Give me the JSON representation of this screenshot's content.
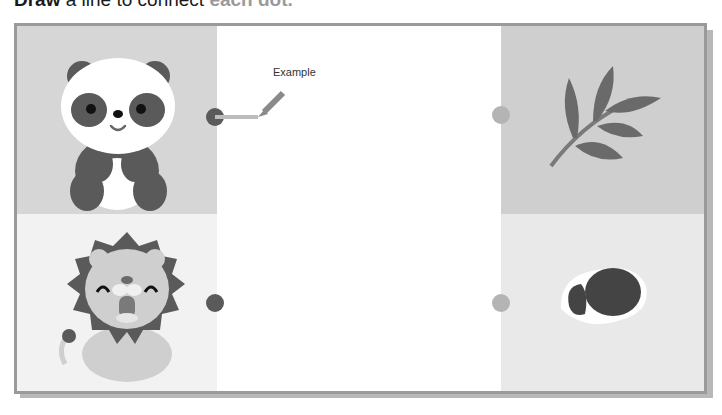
{
  "instruction": {
    "bold": "Draw",
    "text": " a line to connect",
    "rest": " each dot."
  },
  "example": {
    "label": "Example"
  },
  "left_items": [
    {
      "name": "panda",
      "dot_color": "#5a5a5a"
    },
    {
      "name": "lion",
      "dot_color": "#5a5a5a"
    }
  ],
  "right_items": [
    {
      "name": "bamboo",
      "dot_color": "#b4b4b4"
    },
    {
      "name": "meat",
      "dot_color": "#b4b4b4"
    }
  ],
  "colors": {
    "dark": "#5a5a5a",
    "light": "#b4b4b4",
    "border": "#9a9a9a"
  }
}
